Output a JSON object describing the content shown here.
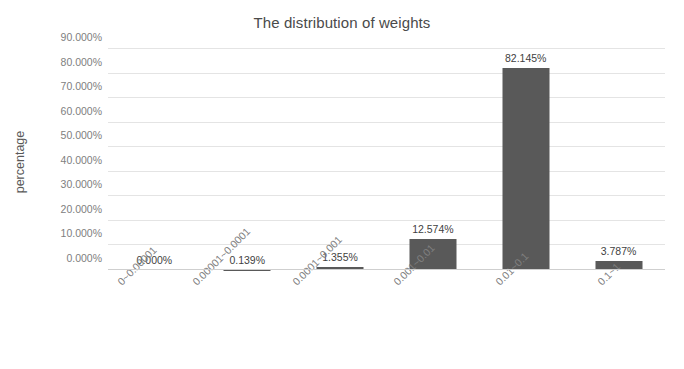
{
  "chart_data": {
    "type": "bar",
    "title": "The distribution of weights",
    "xlabel": "",
    "ylabel": "percentage",
    "categories": [
      "0~0.00001",
      "0.00001~0.0001",
      "0.0001~0.001",
      "0.001~0.01",
      "0.01~0.1",
      "0.1~1"
    ],
    "values": [
      0.0,
      0.139,
      1.355,
      12.574,
      82.145,
      3.787
    ],
    "value_labels": [
      "0.000%",
      "0.139%",
      "1.355%",
      "12.574%",
      "82.145%",
      "3.787%"
    ],
    "ylim": [
      0,
      90
    ],
    "y_ticks": [
      0,
      10,
      20,
      30,
      40,
      50,
      60,
      70,
      80,
      90
    ],
    "y_tick_labels": [
      "0.000%",
      "10.000%",
      "20.000%",
      "30.000%",
      "40.000%",
      "50.000%",
      "60.000%",
      "70.000%",
      "80.000%",
      "90.000%"
    ],
    "grid": true,
    "legend": false,
    "bar_color": "#595959",
    "gridline_color": "#e4e4e4",
    "background_color": "#ffffff"
  }
}
